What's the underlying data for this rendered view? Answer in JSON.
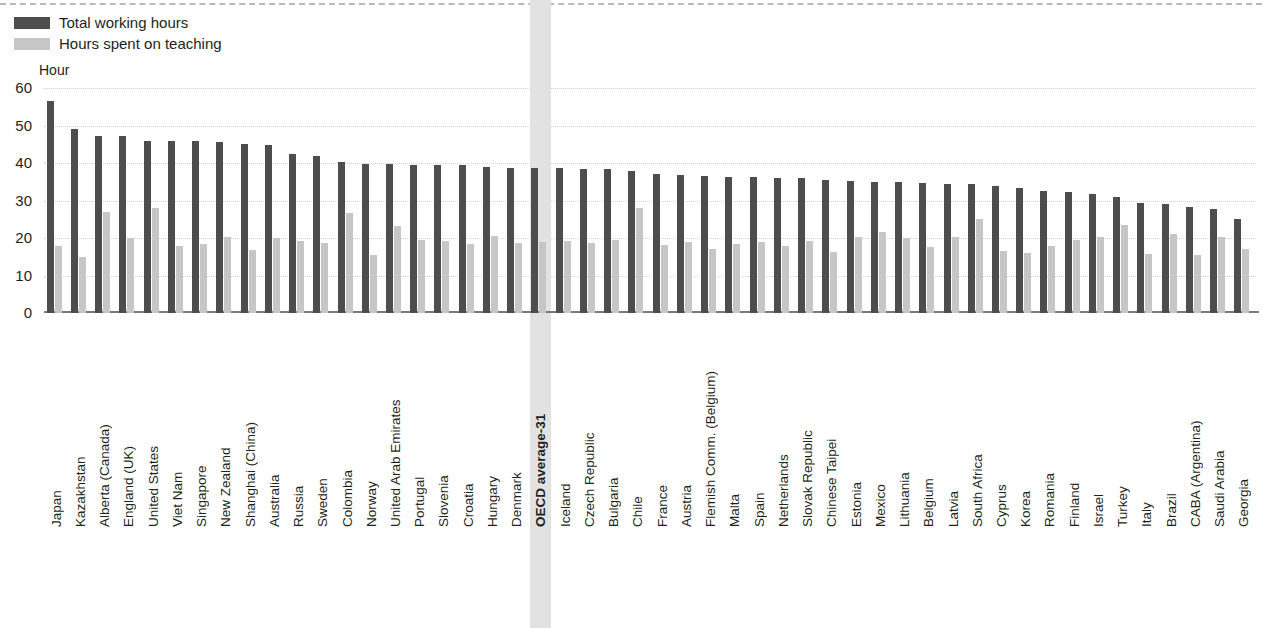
{
  "legend": {
    "items": [
      {
        "label": "Total working hours",
        "color": "#4d4d4d",
        "key": "total"
      },
      {
        "label": "Hours spent on teaching",
        "color": "#c6c6c6",
        "key": "teaching"
      }
    ]
  },
  "axis": {
    "unit_label": "Hour",
    "yticks": [
      "60",
      "50",
      "40",
      "30",
      "20",
      "10",
      "0"
    ]
  },
  "highlight": {
    "category": "OECD average-31",
    "color": "#e2e2e2"
  },
  "chart_data": {
    "type": "bar",
    "title": "",
    "subtitle": "",
    "xlabel": "",
    "ylabel": "Hour",
    "ylim": [
      0,
      60
    ],
    "yticks": [
      0,
      10,
      20,
      30,
      40,
      50,
      60
    ],
    "grid": true,
    "legend_position": "top-left",
    "highlight_category": "OECD average-31",
    "categories": [
      "Japan",
      "Kazakhstan",
      "Alberta (Canada)",
      "England (UK)",
      "United States",
      "Viet Nam",
      "Singapore",
      "New Zealand",
      "Shanghai (China)",
      "Australia",
      "Russia",
      "Sweden",
      "Colombia",
      "Norway",
      "United Arab Emirates",
      "Portugal",
      "Slovenia",
      "Croatia",
      "Hungary",
      "Denmark",
      "OECD average-31",
      "Iceland",
      "Czech Republic",
      "Bulgaria",
      "Chile",
      "France",
      "Austria",
      "Flemish Comm. (Belgium)",
      "Malta",
      "Spain",
      "Netherlands",
      "Slovak Republic",
      "Chinese Taipei",
      "Estonia",
      "Mexico",
      "Lithuania",
      "Belgium",
      "Latvia",
      "South Africa",
      "Cyprus",
      "Korea",
      "Romania",
      "Finland",
      "Israel",
      "Turkey",
      "Italy",
      "Brazil",
      "CABA (Argentina)",
      "Saudi Arabia",
      "Georgia"
    ],
    "series": [
      {
        "name": "Total working hours",
        "color": "#4d4d4d",
        "values": [
          56.5,
          49.0,
          47.3,
          47.3,
          46.0,
          46.0,
          45.8,
          45.5,
          45.2,
          44.8,
          42.5,
          42.0,
          40.3,
          39.8,
          39.7,
          39.6,
          39.5,
          39.4,
          39.0,
          38.8,
          38.8,
          38.7,
          38.5,
          38.3,
          38.0,
          37.0,
          36.8,
          36.6,
          36.2,
          36.2,
          36.0,
          36.0,
          35.4,
          35.2,
          35.0,
          35.0,
          34.6,
          34.5,
          34.4,
          34.0,
          33.4,
          32.6,
          32.4,
          31.8,
          31.0,
          29.3,
          29.0,
          28.2,
          27.8,
          25.0
        ]
      },
      {
        "name": "Hours spent on teaching",
        "color": "#c6c6c6",
        "values": [
          18.0,
          15.0,
          27.0,
          20.0,
          28.0,
          17.8,
          18.5,
          20.2,
          16.8,
          20.0,
          19.2,
          18.6,
          26.6,
          15.6,
          23.2,
          19.5,
          19.3,
          18.4,
          20.6,
          18.6,
          19.0,
          19.2,
          18.6,
          19.4,
          28.0,
          18.2,
          19.0,
          17.2,
          18.5,
          19.0,
          18.0,
          19.3,
          16.4,
          20.2,
          21.6,
          20.0,
          17.5,
          20.2,
          25.0,
          16.6,
          16.0,
          18.0,
          19.6,
          20.4,
          23.6,
          15.7,
          21.0,
          15.6,
          20.2,
          17.2
        ]
      }
    ]
  }
}
